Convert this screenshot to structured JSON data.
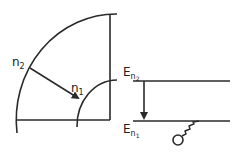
{
  "diagram": {
    "left": {
      "labels": {
        "outer_index": "n",
        "outer_sub": "2",
        "inner_index": "n",
        "inner_sub": "1"
      }
    },
    "right": {
      "labels": {
        "upper_level": "E",
        "upper_sub_n": "n",
        "upper_sub_idx": "2",
        "lower_level": "E",
        "lower_sub_n": "n",
        "lower_sub_idx": "1"
      }
    },
    "colors": {
      "stroke": "#2a2a2a",
      "background": "#ffffff"
    }
  }
}
